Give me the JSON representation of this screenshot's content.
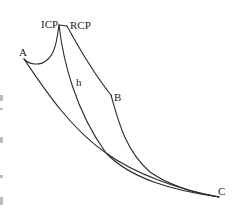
{
  "diagram": {
    "type": "curve-path-diagram",
    "labels": {
      "a": "A",
      "icp": "ICP",
      "rcp": "RCP",
      "h": "h",
      "b": "B",
      "c": "C"
    },
    "colors": {
      "stroke": "#2a2a2a",
      "text": "#222222",
      "background": "#ffffff"
    },
    "curves": [
      {
        "name": "A-to-ICP",
        "description": "concave dip from A rising to ICP peak"
      },
      {
        "name": "ICP-to-RCP",
        "description": "short plateau segment at top"
      },
      {
        "name": "RCP-to-B",
        "description": "descending line from RCP to B corner"
      },
      {
        "name": "B-to-C",
        "description": "descending curve from B to C"
      },
      {
        "name": "ICP-h-to-C",
        "description": "descending curve from ICP through h, merging toward C"
      },
      {
        "name": "A-to-C",
        "description": "lower boundary curve from A to C"
      }
    ]
  },
  "caption": {
    "text": ""
  }
}
